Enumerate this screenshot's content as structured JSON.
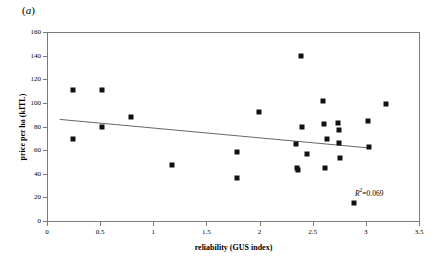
{
  "panel": {
    "label_prefix": "(",
    "label_letter": "a",
    "label_suffix": ")"
  },
  "colors": {
    "marker": "#111111",
    "axis": "#7a7a7a",
    "trend_line": "#555555",
    "background": "#ffffff",
    "text": "#000000"
  },
  "chart_data": {
    "type": "scatter",
    "title": "",
    "subtitle": "",
    "panel_label": "(a)",
    "xlabel": "reliability (GUS index)",
    "ylabel": "price per ha (kITL)",
    "xlim": [
      0,
      3.5
    ],
    "ylim": [
      0,
      160
    ],
    "xticks": [
      0,
      0.5,
      1,
      1.5,
      2,
      2.5,
      3,
      3.5
    ],
    "xtick_labels": [
      "0",
      "0.5",
      "1",
      "1.5",
      "2",
      "2.5",
      "3",
      "3.5"
    ],
    "yticks": [
      0,
      20,
      40,
      60,
      80,
      100,
      120,
      140,
      160
    ],
    "ytick_labels": [
      "0",
      "20",
      "40",
      "60",
      "80",
      "100",
      "120",
      "140",
      "160"
    ],
    "grid": false,
    "legend": false,
    "legend_position": "none",
    "marker_style": "filled-square",
    "series": [
      {
        "name": "municipalities",
        "points": [
          [
            0.24,
            111
          ],
          [
            0.24,
            69
          ],
          [
            0.52,
            111
          ],
          [
            0.52,
            80
          ],
          [
            0.79,
            88
          ],
          [
            1.18,
            47
          ],
          [
            1.79,
            58
          ],
          [
            1.79,
            36
          ],
          [
            1.99,
            92
          ],
          [
            2.34,
            65
          ],
          [
            2.35,
            45
          ],
          [
            2.36,
            43
          ],
          [
            2.39,
            140
          ],
          [
            2.4,
            80
          ],
          [
            2.45,
            57
          ],
          [
            2.6,
            102
          ],
          [
            2.61,
            82
          ],
          [
            2.62,
            45
          ],
          [
            2.63,
            69
          ],
          [
            2.74,
            83
          ],
          [
            2.75,
            77
          ],
          [
            2.75,
            66
          ],
          [
            2.76,
            53
          ],
          [
            2.89,
            15
          ],
          [
            3.02,
            85
          ],
          [
            3.03,
            63
          ],
          [
            3.19,
            99
          ]
        ]
      }
    ],
    "trend_line": {
      "type": "linear-fit",
      "x_start": 0.12,
      "y_start": 86,
      "x_end": 3.01,
      "y_end": 62
    },
    "annotations": [
      {
        "name": "r-squared",
        "symbol": "R",
        "exponent": "2",
        "equals": "=0.069",
        "full_text": "R2=0.069",
        "value": 0.069
      }
    ]
  }
}
